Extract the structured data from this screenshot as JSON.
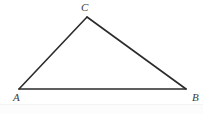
{
  "figure": {
    "name": "triangle-abc",
    "width": 203,
    "height": 114,
    "background_color": "#ffffff",
    "stroke_color": "#2b2b2b",
    "stroke_width": 1.6,
    "label_color": "#3b3b3b",
    "vertices": [
      {
        "label": "C",
        "x": 87,
        "y": 17
      },
      {
        "label": "A",
        "x": 19,
        "y": 89
      },
      {
        "label": "B",
        "x": 186,
        "y": 89
      }
    ],
    "edges": [
      {
        "name": "edge-AC",
        "from": "A",
        "to": "C"
      },
      {
        "name": "edge-CB",
        "from": "C",
        "to": "B"
      },
      {
        "name": "edge-AB",
        "from": "A",
        "to": "B"
      }
    ],
    "labels": {
      "vertex_c": "C",
      "vertex_a": "A",
      "vertex_b": "B"
    }
  }
}
